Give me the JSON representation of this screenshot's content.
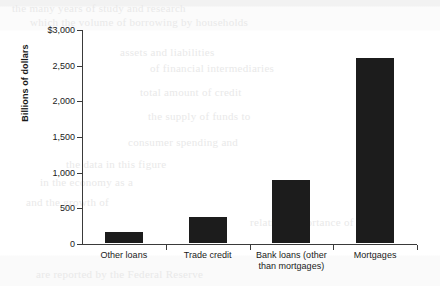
{
  "chart_data": {
    "type": "bar",
    "title": "",
    "xlabel": "",
    "ylabel": "Billions of dollars",
    "ylim": [
      0,
      3000
    ],
    "grid": false,
    "legend": null,
    "categories": [
      "Other loans",
      "Trade credit",
      "Bank loans (other\nthan mortgages)",
      "Mortgages"
    ],
    "values": [
      160,
      360,
      880,
      2600
    ],
    "ytick_values": [
      0,
      500,
      1000,
      1500,
      2000,
      2500,
      3000
    ],
    "ytick_labels": [
      "0",
      "500",
      "1,000",
      "1,500",
      "2,000",
      "2,500",
      "$3,000"
    ],
    "bar_color": "#1c1c1c",
    "axis_color": "#3a3a3a"
  },
  "background_text": {
    "line1": "the many years of study and research",
    "line2": "which the volume of borrowing by households",
    "line3": "assets and liabilities",
    "line4": "of financial intermediaries",
    "line5": "total amount of credit",
    "line6": "the supply of funds to",
    "line7": "consumer spending and",
    "line8": "the data in this figure",
    "line9": "in the economy as a",
    "line10": "and the growth of",
    "line11": "are reported by the Federal Reserve",
    "line12": "relative importance of each"
  }
}
